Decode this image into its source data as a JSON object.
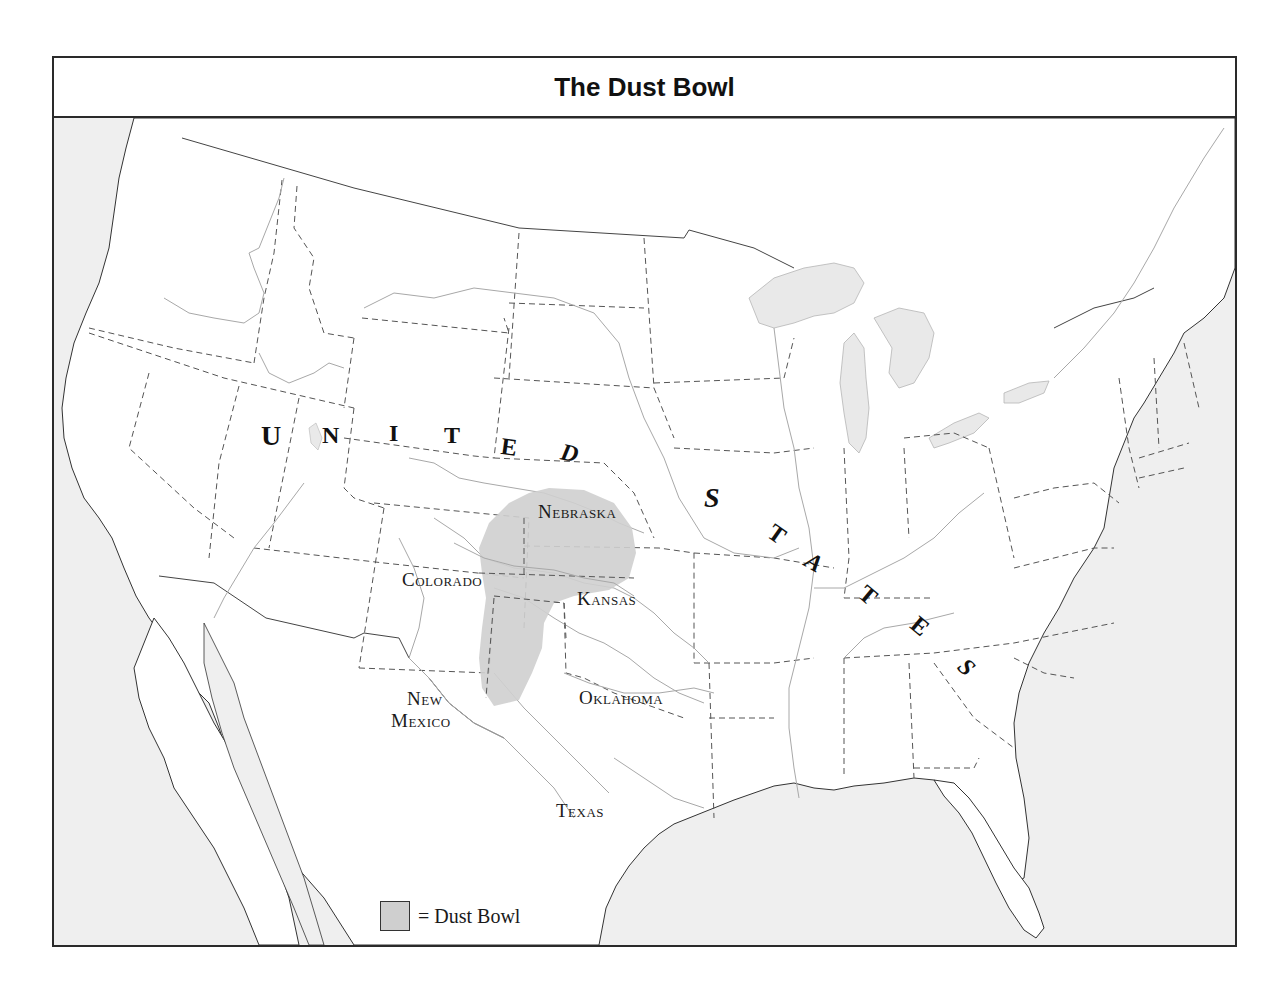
{
  "map": {
    "title": "The Dust Bowl",
    "country_label_letters": {
      "united": [
        "U",
        "N",
        "I",
        "T",
        "E",
        "D"
      ],
      "states": [
        "S",
        "T",
        "A",
        "T",
        "E",
        "S"
      ]
    },
    "state_labels": {
      "nebraska": "Nebraska",
      "colorado": "Colorado",
      "kansas": "Kansas",
      "oklahoma": "Oklahoma",
      "new_mexico_line1": "New",
      "new_mexico_line2": "Mexico",
      "texas": "Texas"
    },
    "legend": {
      "swatch_meaning": "Dust Bowl",
      "text": "= Dust Bowl"
    },
    "colors": {
      "dust_bowl_fill": "#cfcfcf",
      "water_fill": "#efefef",
      "land_fill": "#ffffff",
      "border_color": "#2a2a2a",
      "state_line": "#555555",
      "river_line": "#a8a8a8"
    },
    "highlighted_region": {
      "name": "Dust Bowl",
      "states_covered": [
        "Colorado (southeast)",
        "Kansas (southwest)",
        "Oklahoma (panhandle)",
        "Texas (panhandle)",
        "New Mexico (northeast)"
      ]
    }
  }
}
